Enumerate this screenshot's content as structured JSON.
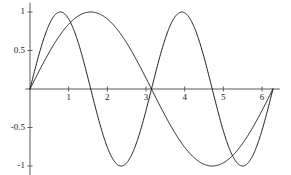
{
  "chart_data": {
    "type": "line",
    "title": "",
    "subtitle": "",
    "xlabel": "",
    "ylabel": "",
    "xlim": [
      -0.12,
      6.46
    ],
    "ylim": [
      -1.12,
      1.12
    ],
    "grid": false,
    "legend": null,
    "legend_position": "none",
    "axis_style": "crossed-at-origin",
    "x_ticks": [
      1,
      2,
      3,
      4,
      5,
      6
    ],
    "x_tick_labels": [
      "1",
      "2",
      "3",
      "4",
      "5",
      "6"
    ],
    "y_ticks": [
      1,
      0.5,
      -0.5,
      -1
    ],
    "y_tick_labels": [
      "1",
      "0.5",
      "-0.5",
      "-1"
    ],
    "series": [
      {
        "name": "sin(x)",
        "formula": "sin(x)",
        "color": "#1a1a1a",
        "linewidth": 1,
        "x_start": 0,
        "x_end": 6.283185307,
        "key_points": [
          {
            "x": 0,
            "y": 0
          },
          {
            "x": 1.5708,
            "y": 1
          },
          {
            "x": 3.1416,
            "y": 0
          },
          {
            "x": 4.7124,
            "y": -1
          },
          {
            "x": 6.2832,
            "y": 0
          }
        ]
      },
      {
        "name": "sin(2x)",
        "formula": "sin(2x)",
        "color": "#1a1a1a",
        "linewidth": 1,
        "x_start": 0,
        "x_end": 6.283185307,
        "key_points": [
          {
            "x": 0,
            "y": 0
          },
          {
            "x": 0.7854,
            "y": 1
          },
          {
            "x": 1.5708,
            "y": 0
          },
          {
            "x": 2.3562,
            "y": -1
          },
          {
            "x": 3.1416,
            "y": 0
          },
          {
            "x": 3.927,
            "y": 1
          },
          {
            "x": 4.7124,
            "y": 0
          },
          {
            "x": 5.4978,
            "y": -1
          },
          {
            "x": 6.2832,
            "y": 0
          }
        ]
      }
    ],
    "colors": {
      "axis": "#5a5a5a",
      "curve": "#1a1a1a",
      "background": "#ffffff",
      "tick_text": "#1a1a1a"
    }
  }
}
